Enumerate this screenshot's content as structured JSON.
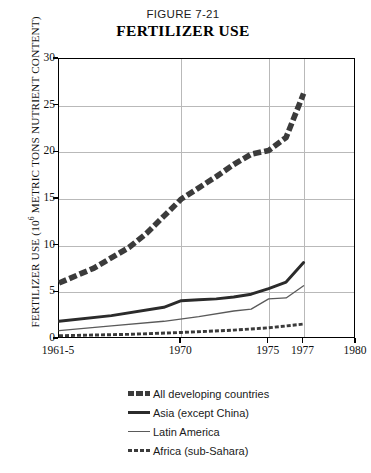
{
  "figure": {
    "number": "FIGURE 7-21",
    "title": "FERTILIZER USE"
  },
  "chart_data": {
    "type": "line",
    "title": "FERTILIZER USE",
    "subtitle": "FIGURE 7-21",
    "xlabel": "",
    "ylabel": "FERTILIZER USE (10⁶ METRIC TONS NUTRIENT CONTENT)",
    "ylabel_parts": {
      "pre": "FERTILIZER USE (10",
      "sup": "6",
      "post": " METRIC TONS NUTRIENT CONTENT)"
    },
    "ylim": [
      0,
      30
    ],
    "yticks": [
      0,
      5,
      10,
      15,
      20,
      25,
      30
    ],
    "xlim": [
      1963,
      1980
    ],
    "xticks": [
      1963,
      1970,
      1975,
      1977,
      1980
    ],
    "xticklabels": [
      "1961-5",
      "1970",
      "1975",
      "1977",
      "1980"
    ],
    "grid": true,
    "legend_position": "below",
    "series": [
      {
        "name": "All developing countries",
        "style": "thick-dashed",
        "color": "#3b3b3b",
        "x": [
          1963,
          1965,
          1967,
          1968,
          1970,
          1971,
          1972,
          1973,
          1974,
          1975,
          1976,
          1977
        ],
        "values": [
          6.0,
          7.6,
          9.8,
          11.3,
          15.0,
          16.2,
          17.4,
          18.7,
          19.8,
          20.2,
          21.6,
          26.3
        ]
      },
      {
        "name": "Asia (except China)",
        "style": "thick-solid",
        "color": "#2b2b2b",
        "x": [
          1963,
          1966,
          1969,
          1970,
          1971,
          1972,
          1973,
          1974,
          1975,
          1976,
          1977
        ],
        "values": [
          1.9,
          2.5,
          3.4,
          4.1,
          4.2,
          4.3,
          4.5,
          4.8,
          5.4,
          6.1,
          8.2
        ]
      },
      {
        "name": "Latin America",
        "style": "thin-solid",
        "color": "#5a5a5a",
        "x": [
          1963,
          1966,
          1969,
          1971,
          1973,
          1974,
          1975,
          1976,
          1977
        ],
        "values": [
          0.9,
          1.4,
          1.9,
          2.4,
          3.0,
          3.2,
          4.3,
          4.4,
          5.7
        ]
      },
      {
        "name": "Africa (sub-Sahara)",
        "style": "thin-dashed",
        "color": "#3b3b3b",
        "x": [
          1963,
          1967,
          1970,
          1973,
          1975,
          1977
        ],
        "values": [
          0.35,
          0.5,
          0.7,
          0.95,
          1.2,
          1.6
        ]
      }
    ]
  },
  "legend": {
    "items": [
      {
        "label": "All developing countries",
        "style": "thick-dashed"
      },
      {
        "label": "Asia (except China)",
        "style": "thick-solid"
      },
      {
        "label": "Latin America",
        "style": "thin-solid"
      },
      {
        "label": "Africa (sub-Sahara)",
        "style": "thin-dashed"
      }
    ]
  }
}
